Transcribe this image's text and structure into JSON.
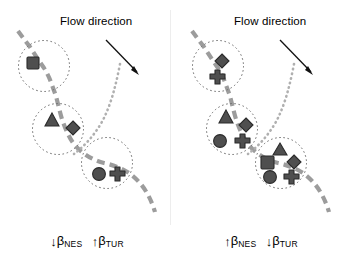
{
  "figure": {
    "background_color": "#ffffff",
    "shape_fill": "#4f4f4f",
    "shape_stroke": "#2b2b2b",
    "river_color": "#9c9c9c",
    "tributary_color": "#b0b0b0",
    "circle_stroke": "#6e6e6e",
    "arrow_color": "#111111",
    "divider_color": "#ededed"
  },
  "panels": [
    {
      "id": "left-panel",
      "flow_label": "Flow direction",
      "caption": {
        "parts": [
          {
            "arrow": "↓",
            "arrow_name": "down-arrow",
            "symbol": "β",
            "subscript": "NES"
          },
          {
            "arrow": "↑",
            "arrow_name": "up-arrow",
            "symbol": "β",
            "subscript": "TUR"
          }
        ],
        "text": "↓βNES ↑βTUR"
      },
      "sites": [
        {
          "id": "site-upstream",
          "label": "upstream site",
          "shapes": [
            "square"
          ]
        },
        {
          "id": "site-midstream",
          "label": "midstream site",
          "shapes": [
            "triangle",
            "diamond"
          ]
        },
        {
          "id": "site-downstream",
          "label": "downstream site",
          "shapes": [
            "circle",
            "cross"
          ]
        }
      ]
    },
    {
      "id": "right-panel",
      "flow_label": "Flow direction",
      "caption": {
        "parts": [
          {
            "arrow": "↑",
            "arrow_name": "up-arrow",
            "symbol": "β",
            "subscript": "NES"
          },
          {
            "arrow": "↓",
            "arrow_name": "down-arrow",
            "symbol": "β",
            "subscript": "TUR"
          }
        ],
        "text": "↑βNES ↓βTUR"
      },
      "sites": [
        {
          "id": "site-upstream",
          "label": "upstream site",
          "shapes": [
            "diamond",
            "cross"
          ]
        },
        {
          "id": "site-midstream",
          "label": "midstream site",
          "shapes": [
            "triangle",
            "diamond",
            "circle",
            "cross"
          ]
        },
        {
          "id": "site-downstream",
          "label": "downstream site",
          "shapes": [
            "triangle",
            "square",
            "diamond",
            "circle",
            "cross"
          ]
        }
      ]
    }
  ]
}
